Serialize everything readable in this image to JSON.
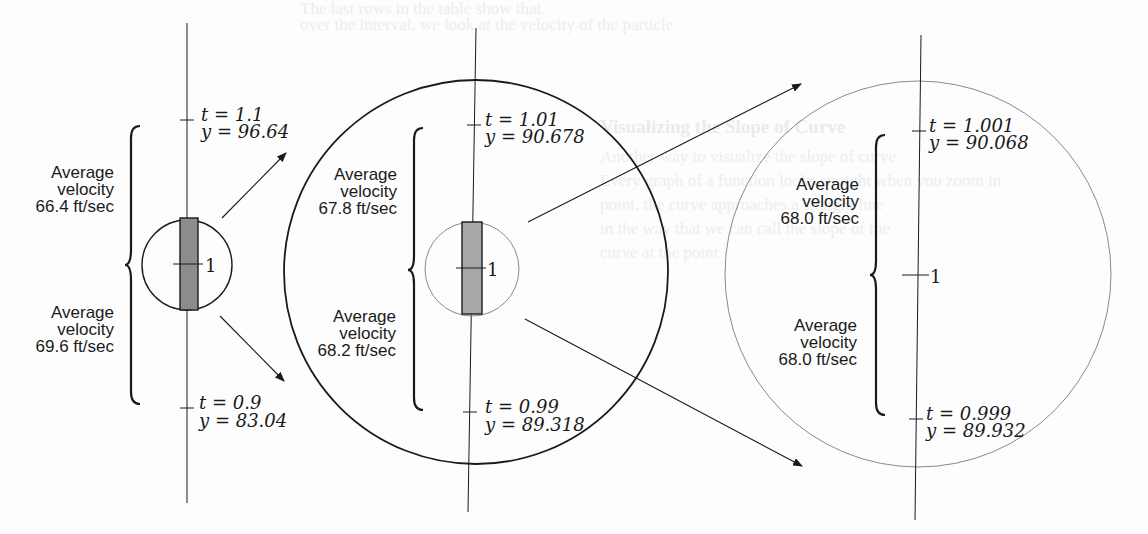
{
  "figure": {
    "center_label": "1",
    "unit_label": "ft/sec",
    "avg_label_line1": "Average",
    "avg_label_line2": "velocity",
    "panels": [
      {
        "name": "left",
        "upper_tick": {
          "t_text": "t = 1.1",
          "y_text": "y = 96.64",
          "t": 1.1,
          "y": 96.64
        },
        "lower_tick": {
          "t_text": "t = 0.9",
          "y_text": "y = 83.04",
          "t": 0.9,
          "y": 83.04
        },
        "upper_avg_velocity": "66.4 ft/sec",
        "lower_avg_velocity": "69.6 ft/sec"
      },
      {
        "name": "middle",
        "upper_tick": {
          "t_text": "t = 1.01",
          "y_text": "y = 90.678",
          "t": 1.01,
          "y": 90.678
        },
        "lower_tick": {
          "t_text": "t = 0.99",
          "y_text": "y = 89.318",
          "t": 0.99,
          "y": 89.318
        },
        "upper_avg_velocity": "67.8 ft/sec",
        "lower_avg_velocity": "68.2 ft/sec"
      },
      {
        "name": "right",
        "upper_tick": {
          "t_text": "t = 1.001",
          "y_text": "y = 90.068",
          "t": 1.001,
          "y": 90.068
        },
        "lower_tick": {
          "t_text": "t = 0.999",
          "y_text": "y = 89.932",
          "t": 0.999,
          "y": 89.932
        },
        "upper_avg_velocity": "68.0 ft/sec",
        "lower_avg_velocity": "68.0 ft/sec"
      }
    ]
  },
  "background_text": {
    "heading": "Visualizing the Slope of Curve"
  },
  "colors": {
    "ink": "#1a1a1a",
    "bar_fill": "#8c8c8c",
    "bar_fill_light": "#a8a8a8",
    "thin_circle": "#8a8a8a",
    "page": "#fdfdfd"
  }
}
